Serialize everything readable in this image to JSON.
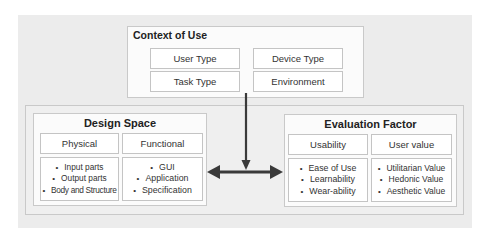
{
  "context": {
    "title": "Context of Use",
    "cells": [
      "User Type",
      "Device Type",
      "Task Type",
      "Environment"
    ]
  },
  "design_space": {
    "title": "Design Space",
    "columns": [
      {
        "header": "Physical",
        "items": [
          "Input parts",
          "Output parts",
          "Body and Structure"
        ]
      },
      {
        "header": "Functional",
        "items": [
          "GUI",
          "Application",
          "Specification"
        ]
      }
    ]
  },
  "evaluation": {
    "title": "Evaluation Factor",
    "columns": [
      {
        "header": "Usability",
        "items": [
          "Ease of Use",
          "Learnability",
          "Wear-ability"
        ]
      },
      {
        "header": "User value",
        "items": [
          "Utilitarian Value",
          "Hedonic Value",
          "Aesthetic Value"
        ]
      }
    ]
  },
  "colors": {
    "arrow": "#3a3a3a",
    "background": "#ececec",
    "border": "#c9c9c9"
  }
}
